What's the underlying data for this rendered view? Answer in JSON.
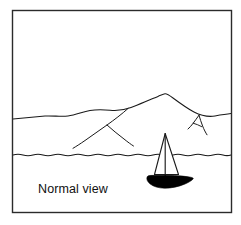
{
  "figure": {
    "caption": "Normal view",
    "panel_border_color": "#2b2b2b",
    "ink_color": "#1a1a1a",
    "background_color": "#ffffff",
    "hull_fill_color": "#000000",
    "sail_fill_color": "#ffffff",
    "elements": {
      "frame_name": "illustration-frame",
      "sky_name": "sky-area",
      "sea_name": "sea-area",
      "mountain_name": "mountain-ridge",
      "waterline_name": "waterline",
      "boat_name": "sailboat",
      "caption_name": "caption-normal-view"
    }
  },
  "geometry": {
    "frame": {
      "x": 12,
      "y": 10,
      "width": 220,
      "height": 203
    },
    "waterline_y": 155,
    "caption_position": {
      "x": 38,
      "y": 193
    },
    "mountain_peak": {
      "x": 165,
      "y": 94
    },
    "mast_top": {
      "x": 165,
      "y": 133
    }
  }
}
